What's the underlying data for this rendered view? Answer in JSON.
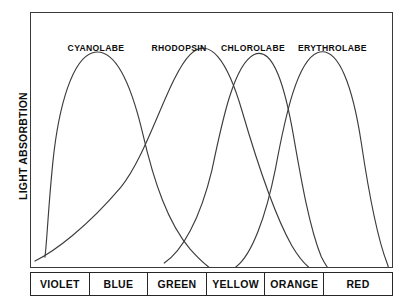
{
  "chart_data": {
    "type": "line",
    "title": "",
    "xlabel": "",
    "ylabel": "LIGHT ABSORBTION",
    "grid": false,
    "legend_position": "inside-top",
    "xlim": [
      0,
      100
    ],
    "ylim": [
      0,
      100
    ],
    "x_band_labels": [
      "VIOLET",
      "BLUE",
      "GREEN",
      "YELLOW",
      "ORANGE",
      "RED"
    ],
    "series": [
      {
        "name": "CYANOLABE",
        "peak_x": 18,
        "label_x_pct": 18,
        "path": "M 14 246 C 16 232, 17 200, 22 150 C 28 92, 42 46, 62 40 C 84 34, 100 70, 112 120 C 124 172, 138 212, 160 238 C 176 256, 186 262, 196 266",
        "values_x": [
          4,
          8,
          12,
          18,
          24,
          30,
          38,
          46,
          54,
          62,
          70,
          78
        ],
        "values_y": [
          4,
          22,
          58,
          92,
          97,
          80,
          54,
          34,
          20,
          11,
          6,
          2
        ]
      },
      {
        "name": "RHODOPSIN",
        "peak_x": 44,
        "label_x_pct": 41,
        "path": "M 4 250 C 24 240, 56 216, 90 176 C 118 142, 138 64, 160 42 C 180 22, 198 50, 212 98 C 226 146, 244 202, 262 234 C 276 258, 288 264, 300 266",
        "values_x": [
          1,
          8,
          16,
          26,
          36,
          44,
          52,
          60,
          68,
          76,
          84
        ],
        "values_y": [
          6,
          16,
          30,
          52,
          84,
          97,
          78,
          50,
          28,
          12,
          3
        ]
      },
      {
        "name": "CHLOROLABE",
        "peak_x": 55,
        "label_x_pct": 61,
        "path": "M 134 252 C 152 240, 170 208, 182 158 C 192 110, 204 52, 224 42 C 244 32, 256 78, 264 124 C 272 170, 280 216, 292 246 C 298 258, 302 262, 306 266",
        "values_x": [
          28,
          34,
          40,
          47,
          55,
          62,
          70,
          78,
          86
        ],
        "values_y": [
          4,
          16,
          44,
          80,
          97,
          72,
          40,
          16,
          3
        ]
      },
      {
        "name": "ERYTHROLABE",
        "peak_x": 74,
        "label_x_pct": 83,
        "path": "M 206 256 C 222 244, 236 206, 246 156 C 256 102, 268 48, 288 40 C 310 32, 324 78, 332 130 C 340 184, 348 226, 358 252 C 360 258, 361 262, 362 266",
        "values_x": [
          46,
          54,
          60,
          66,
          74,
          82,
          90,
          96,
          100
        ],
        "values_y": [
          3,
          18,
          46,
          78,
          97,
          68,
          32,
          10,
          2
        ]
      }
    ]
  },
  "figure": {
    "ylabel": "LIGHT ABSORBTION",
    "series_labels": [
      "CYANOLABE",
      "RHODOPSIN",
      "CHLOROLABE",
      "ERYTHROLABE"
    ],
    "bands": [
      "VIOLET",
      "BLUE",
      "GREEN",
      "YELLOW",
      "ORANGE",
      "RED"
    ],
    "colors": {
      "curve_stroke": "#3c3c3c",
      "frame": "#3a3a3a",
      "text": "#0d0d0d",
      "background": "#ffffff"
    }
  }
}
